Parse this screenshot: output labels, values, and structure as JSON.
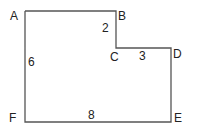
{
  "diagram": {
    "type": "l-shaped-polygon",
    "stroke_color": "#555555",
    "vertices": [
      {
        "label": "A",
        "x": 25,
        "y": 11
      },
      {
        "label": "B",
        "x": 116,
        "y": 11
      },
      {
        "label": "C",
        "x": 116,
        "y": 48
      },
      {
        "label": "D",
        "x": 171,
        "y": 48
      },
      {
        "label": "E",
        "x": 171,
        "y": 122
      },
      {
        "label": "F",
        "x": 25,
        "y": 122
      }
    ],
    "side_lengths": [
      {
        "side": "BC",
        "label": "2"
      },
      {
        "side": "CD",
        "label": "3"
      },
      {
        "side": "AF",
        "label": "6"
      },
      {
        "side": "FE",
        "label": "8"
      }
    ]
  },
  "labels": {
    "A": "A",
    "B": "B",
    "C": "C",
    "D": "D",
    "E": "E",
    "F": "F",
    "len_bc": "2",
    "len_cd": "3",
    "len_af": "6",
    "len_fe": "8"
  }
}
